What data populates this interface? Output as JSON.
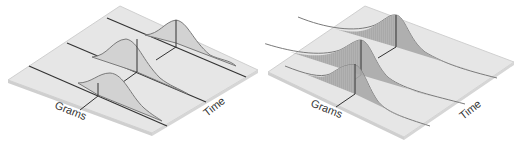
{
  "figure": {
    "colors": {
      "background": "#ffffff",
      "platform": "#e6e6e6",
      "platform_edge": "#c8c8c8",
      "baseline": "#333333",
      "curve_fill_left": "#d2d2d2",
      "curve_fill_right_light": "#cfcfcf",
      "curve_fill_right_dark": "#a9a9a9",
      "curve_stroke": "#7a7a7a",
      "center_line": "#333333"
    },
    "panels": [
      {
        "id": "left",
        "axis_labels": {
          "x": "Grams",
          "y": "Time"
        },
        "curve_count": 3,
        "shading": "uniform light fill"
      },
      {
        "id": "right",
        "axis_labels": {
          "x": "Grams",
          "y": "Time"
        },
        "curve_count": 3,
        "shading": "hatched, darker fill"
      }
    ]
  }
}
